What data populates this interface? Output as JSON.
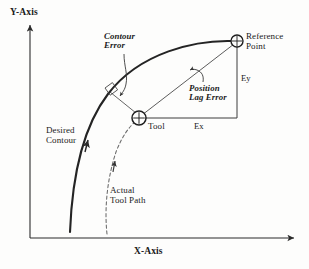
{
  "diagram": {
    "axes": {
      "y_label": "Y-Axis",
      "x_label": "X-Axis"
    },
    "labels": {
      "contour_error": "Contour\nError",
      "reference_point": "Reference\nPoint",
      "position_lag_error": "Position\nLag Error",
      "desired_contour": "Desired\nContour",
      "actual_tool_path": "Actual\nTool Path",
      "tool": "Tool",
      "ey": "Ey",
      "ex": "Ex"
    },
    "markers": [
      {
        "name": "tool-marker",
        "label": "Tool",
        "x": 139,
        "y": 118,
        "radius": 7
      },
      {
        "name": "reference-point-marker",
        "label": "Reference Point",
        "x": 237,
        "y": 41,
        "radius": 6
      }
    ],
    "colors": {
      "ink": "#1a1a1a",
      "line": "#2b2b2b",
      "thin_line": "#555555",
      "background": "#fdfdfc"
    },
    "curves": {
      "desired_contour": "thick solid arc from lower-left to reference point",
      "actual_tool_path": "dashed arc from lower area up to tool marker"
    },
    "annotations": {
      "right_angle": "perpendicular square marker on desired contour at contour error foot",
      "contour_error_arrow": "curved leader arrow from Contour Error label to perpendicular offset",
      "position_lag_arrow": "curved leader arrow from Position Lag Error label to hypotenuse"
    }
  }
}
